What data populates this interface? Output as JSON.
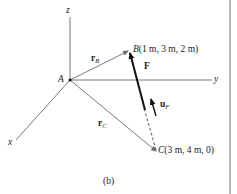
{
  "figure": {
    "caption": "(b)",
    "axes": {
      "x": "x",
      "y": "y",
      "z": "z"
    },
    "origin": {
      "label": "A"
    },
    "points": [
      {
        "label": "B",
        "coords": "(1 m, 3 m, 2 m)"
      },
      {
        "label": "C",
        "coords": "(3 m, 4 m, 0)"
      }
    ],
    "vectors": [
      {
        "name": "r",
        "sub": "B",
        "from": "A",
        "to": "B"
      },
      {
        "name": "r",
        "sub": "C",
        "from": "A",
        "to": "C"
      },
      {
        "name": "F",
        "from": "C",
        "to": "B"
      },
      {
        "name": "u",
        "sub": "F",
        "direction": "C to B"
      }
    ],
    "colors": {
      "line": "#555555",
      "vector_gray": "#6a6a6a",
      "force": "#111111",
      "edge": "#b8b8b8"
    }
  }
}
